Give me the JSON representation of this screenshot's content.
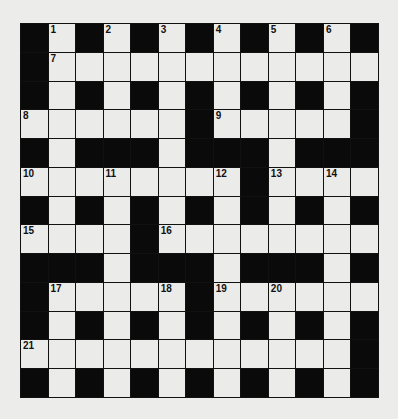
{
  "puzzle": {
    "type": "crossword",
    "rows": 13,
    "cols": 13,
    "legend": "B = black square, W = white square, number = numbered white square",
    "grid": [
      [
        "B",
        "1",
        "B",
        "2",
        "B",
        "3",
        "B",
        "4",
        "B",
        "5",
        "B",
        "6",
        "B"
      ],
      [
        "B",
        "7",
        "W",
        "W",
        "W",
        "W",
        "W",
        "W",
        "W",
        "W",
        "W",
        "W",
        "W"
      ],
      [
        "B",
        "W",
        "B",
        "W",
        "B",
        "W",
        "B",
        "W",
        "B",
        "W",
        "B",
        "W",
        "B"
      ],
      [
        "8",
        "W",
        "W",
        "W",
        "W",
        "W",
        "B",
        "9",
        "W",
        "W",
        "W",
        "W",
        "B"
      ],
      [
        "B",
        "W",
        "B",
        "B",
        "B",
        "W",
        "B",
        "B",
        "B",
        "W",
        "B",
        "B",
        "B"
      ],
      [
        "10",
        "W",
        "W",
        "11",
        "W",
        "W",
        "W",
        "12",
        "B",
        "13",
        "W",
        "14",
        "W"
      ],
      [
        "B",
        "W",
        "B",
        "W",
        "B",
        "W",
        "B",
        "W",
        "B",
        "W",
        "B",
        "W",
        "B"
      ],
      [
        "15",
        "W",
        "W",
        "W",
        "B",
        "16",
        "W",
        "W",
        "W",
        "W",
        "W",
        "W",
        "W"
      ],
      [
        "B",
        "B",
        "B",
        "W",
        "B",
        "B",
        "B",
        "W",
        "B",
        "B",
        "B",
        "W",
        "B"
      ],
      [
        "B",
        "17",
        "W",
        "W",
        "W",
        "18",
        "B",
        "19",
        "W",
        "20",
        "W",
        "W",
        "W"
      ],
      [
        "B",
        "W",
        "B",
        "W",
        "B",
        "W",
        "B",
        "W",
        "B",
        "W",
        "B",
        "W",
        "B"
      ],
      [
        "21",
        "W",
        "W",
        "W",
        "W",
        "W",
        "W",
        "W",
        "W",
        "W",
        "W",
        "W",
        "B"
      ],
      [
        "B",
        "W",
        "B",
        "W",
        "B",
        "W",
        "B",
        "W",
        "B",
        "W",
        "B",
        "W",
        "B"
      ]
    ],
    "clue_numbers": [
      1,
      2,
      3,
      4,
      5,
      6,
      7,
      8,
      9,
      10,
      11,
      12,
      13,
      14,
      15,
      16,
      17,
      18,
      19,
      20,
      21
    ],
    "colors": {
      "background": "#ececea",
      "white_square": "#ebebea",
      "black_square": "#0a0a0a",
      "number_text": "#111111"
    }
  }
}
